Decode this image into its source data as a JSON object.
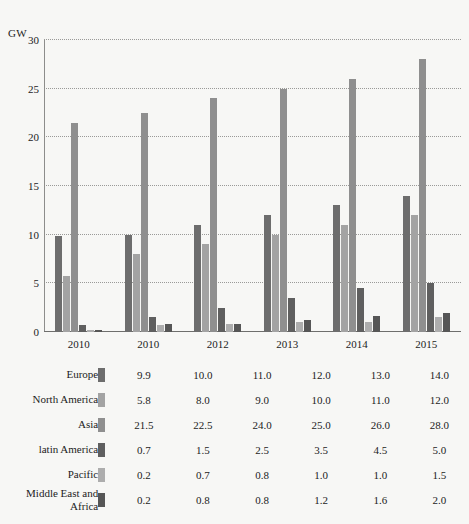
{
  "chart_data": {
    "type": "bar",
    "title": "",
    "subtitle": "",
    "xlabel": "",
    "ylabel": "GW",
    "unit_label": "GW",
    "ylim": [
      0,
      30
    ],
    "yticks": [
      0,
      5,
      10,
      15,
      20,
      25,
      30
    ],
    "ytick_labels": [
      "0",
      "5",
      "10",
      "15",
      "20",
      "25",
      "30"
    ],
    "grid": true,
    "grid_style": "dotted-horizontal",
    "legend_position": "table-below",
    "categories": [
      "2010",
      "2010",
      "2012",
      "2013",
      "2014",
      "2015"
    ],
    "series": [
      {
        "name": "Europe",
        "color": "#6d6d6d",
        "values": [
          9.9,
          10.0,
          11.0,
          12.0,
          13.0,
          14.0
        ],
        "labels": [
          "9.9",
          "10.0",
          "11.0",
          "12.0",
          "13.0",
          "14.0"
        ]
      },
      {
        "name": "North America",
        "color": "#a3a3a3",
        "values": [
          5.8,
          8.0,
          9.0,
          10.0,
          11.0,
          12.0
        ],
        "labels": [
          "5.8",
          "8.0",
          "9.0",
          "10.0",
          "11.0",
          "12.0"
        ]
      },
      {
        "name": "Asia",
        "color": "#8f8f8f",
        "values": [
          21.5,
          22.5,
          24.0,
          25.0,
          26.0,
          28.0
        ],
        "labels": [
          "21.5",
          "22.5",
          "24.0",
          "25.0",
          "26.0",
          "28.0"
        ]
      },
      {
        "name": "latin America",
        "color": "#5f5f5f",
        "values": [
          0.7,
          1.5,
          2.5,
          3.5,
          4.5,
          5.0
        ],
        "labels": [
          "0.7",
          "1.5",
          "2.5",
          "3.5",
          "4.5",
          "5.0"
        ]
      },
      {
        "name": "Pacific",
        "color": "#adadad",
        "values": [
          0.2,
          0.7,
          0.8,
          1.0,
          1.0,
          1.5
        ],
        "labels": [
          "0.2",
          "0.7",
          "0.8",
          "1.0",
          "1.0",
          "1.5"
        ]
      },
      {
        "name": "Middle East and Africa",
        "color": "#565656",
        "values": [
          0.2,
          0.8,
          0.8,
          1.2,
          1.6,
          2.0
        ],
        "labels": [
          "0.2",
          "0.8",
          "0.8",
          "1.2",
          "1.6",
          "2.0"
        ]
      }
    ]
  },
  "table": {
    "rows": [
      {
        "name": "Europe",
        "color": "#6d6d6d",
        "values": [
          "9.9",
          "10.0",
          "11.0",
          "12.0",
          "13.0",
          "14.0"
        ]
      },
      {
        "name": "North America",
        "color": "#a3a3a3",
        "values": [
          "5.8",
          "8.0",
          "9.0",
          "10.0",
          "11.0",
          "12.0"
        ]
      },
      {
        "name": "Asia",
        "color": "#8f8f8f",
        "values": [
          "21.5",
          "22.5",
          "24.0",
          "25.0",
          "26.0",
          "28.0"
        ]
      },
      {
        "name": "latin America",
        "color": "#5f5f5f",
        "values": [
          "0.7",
          "1.5",
          "2.5",
          "3.5",
          "4.5",
          "5.0"
        ]
      },
      {
        "name": "Pacific",
        "color": "#adadad",
        "values": [
          "0.2",
          "0.7",
          "0.8",
          "1.0",
          "1.0",
          "1.5"
        ]
      },
      {
        "name": "Middle East and Africa",
        "color": "#565656",
        "values": [
          "0.2",
          "0.8",
          "0.8",
          "1.2",
          "1.6",
          "2.0"
        ]
      }
    ]
  },
  "style": {
    "background": "#f7f7f5",
    "axis_color": "#6f6f6d",
    "grid_color": "#9a9a98",
    "text_color": "#1c1c1c"
  }
}
